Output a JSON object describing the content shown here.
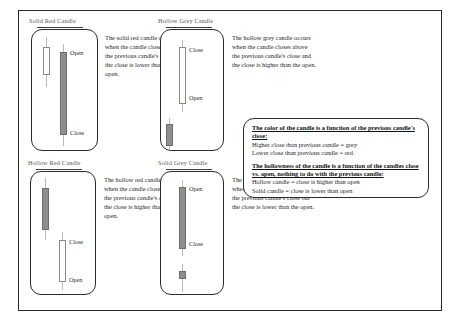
{
  "document": {
    "title": "Candlestick Color and Hollowness Reference"
  },
  "panels": [
    {
      "id": "solid-red-candle",
      "title": "Solid Red Candle",
      "description": "The solid red candle occurs when the candle closes below the previous candle's close and the close is lower than the open.",
      "chart": {
        "previous_candle": {
          "style": "hollow",
          "position": "upper-left"
        },
        "main_candle": {
          "style": "solid",
          "top_label": "Open",
          "bottom_label": "Close"
        }
      }
    },
    {
      "id": "hollow-grey-candle",
      "title": "Hollow Grey Candle",
      "description": "The hollow grey candle occurs when the candle closes above the previous candle's close and the close is higher than the open.",
      "chart": {
        "previous_candle": {
          "style": "solid",
          "position": "lower-left"
        },
        "main_candle": {
          "style": "hollow",
          "top_label": "Close",
          "bottom_label": "Open"
        }
      }
    },
    {
      "id": "hollow-red-candle",
      "title": "Hollow Red Candle",
      "description": "The hollow red candle occurs when the candle closes below the previous candle's close but the close is higher than the open.",
      "chart": {
        "previous_candle": {
          "style": "solid",
          "position": "upper-left"
        },
        "main_candle": {
          "style": "hollow",
          "top_label": "Close",
          "bottom_label": "Open"
        }
      }
    },
    {
      "id": "solid-grey-candle",
      "title": "Solid Grey Candle",
      "description": "The solid grey candle occurs when the candle closes above the previous candle's close but the close is lower than the open.",
      "chart": {
        "previous_candle": {
          "style": "solid",
          "position": "lower-left"
        },
        "main_candle": {
          "style": "solid",
          "top_label": "Open",
          "bottom_label": "Close"
        }
      }
    }
  ],
  "legend": {
    "color_rule_heading": "The color of the candle is a function of the previous candle's close:",
    "color_rule_lines": [
      "Higher close than previous candle = grey",
      "Lower close than previous candle = red"
    ],
    "hollow_rule_heading": "The hollowness of the candle is a function of the candles close vs. open, nothing to do with the previous candle:",
    "hollow_rule_lines": [
      "Hollow candle = close is higher than open",
      "Solid candle = close is lower than open"
    ]
  },
  "colors": {
    "frame": "#262626",
    "solid_body": "#8e8e8e",
    "hollow_body": "#ffffff",
    "wick": "#b9b9b9",
    "title_text": "#575757",
    "body_text": "#1f1f1f"
  }
}
